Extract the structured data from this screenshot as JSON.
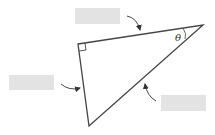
{
  "diagram": {
    "type": "right-triangle",
    "angle_label": "θ",
    "labels": [
      {
        "id": "top",
        "text": "",
        "points_to": "adjacent side (top)"
      },
      {
        "id": "left",
        "text": "",
        "points_to": "opposite side (left)"
      },
      {
        "id": "right",
        "text": "",
        "points_to": "hypotenuse"
      }
    ],
    "colors": {
      "stroke": "#444444",
      "label_box": "#e3e3e3",
      "background": "#ffffff"
    }
  }
}
